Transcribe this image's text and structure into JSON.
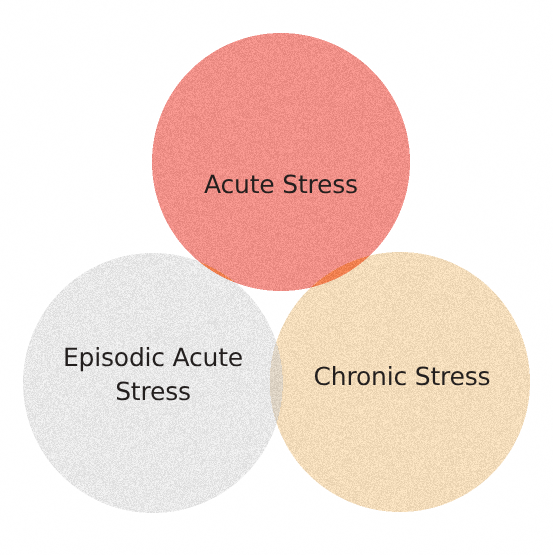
{
  "diagram": {
    "type": "venn",
    "title": "",
    "background_color": "#FFFFFF",
    "width": 553,
    "height": 555,
    "set_count": 3,
    "texture": "speckled-paper-scan-noise",
    "sets": [
      {
        "id": "acute-stress",
        "label": "Acute Stress",
        "color": "#F09088",
        "color_name": "salmon-pink",
        "position": "top",
        "center_x": 281,
        "center_y": 162,
        "radius": 129,
        "label_x": 281,
        "label_y": 185
      },
      {
        "id": "episodic-acute-stress",
        "label": "Episodic Acute\nStress",
        "color": "#E8E8E8",
        "color_name": "light-gray",
        "position": "bottom-left",
        "center_x": 153,
        "center_y": 383,
        "radius": 130,
        "label_x": 153,
        "label_y": 375
      },
      {
        "id": "chronic-stress",
        "label": "Chronic Stress",
        "color": "#F3DCBA",
        "color_name": "tan-peach",
        "position": "bottom-right",
        "center_x": 400,
        "center_y": 382,
        "radius": 130,
        "label_x": 402,
        "label_y": 379
      }
    ],
    "intersections": [
      {
        "id": "acute-and-episodic",
        "sets": [
          "acute-stress",
          "episodic-acute-stress"
        ],
        "color": "#F0804F",
        "label": ""
      },
      {
        "id": "acute-and-chronic",
        "sets": [
          "acute-stress",
          "chronic-stress"
        ],
        "color": "#F0804F",
        "label": ""
      },
      {
        "id": "episodic-and-chronic",
        "sets": [
          "episodic-acute-stress",
          "chronic-stress"
        ],
        "color": "#DDD3C4",
        "label": ""
      },
      {
        "id": "all-three",
        "sets": [
          "acute-stress",
          "episodic-acute-stress",
          "chronic-stress"
        ],
        "color": "#E8B195",
        "label": ""
      }
    ],
    "text_color": "#231F1E",
    "label_font_size": 25
  }
}
